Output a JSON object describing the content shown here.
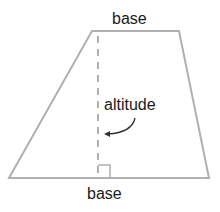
{
  "diagram": {
    "type": "trapezoid",
    "labels": {
      "top_base": "base",
      "bottom_base": "base",
      "altitude": "altitude"
    },
    "colors": {
      "outline": "#b0b0b0",
      "text": "#1a1a1a",
      "arrow": "#333333",
      "background": "#ffffff"
    },
    "vertices": {
      "top_left": [
        92,
        31
      ],
      "top_right": [
        179,
        31
      ],
      "bottom_right": [
        209,
        178
      ],
      "bottom_left": [
        9,
        178
      ]
    },
    "altitude_line": {
      "x": 98,
      "y1": 36,
      "y2": 178,
      "style": "dashed"
    },
    "right_angle_marker": {
      "x": 98,
      "y": 164,
      "size": 12
    }
  }
}
